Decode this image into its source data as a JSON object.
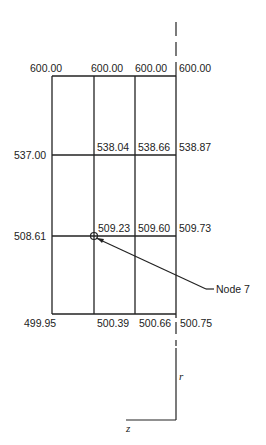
{
  "figure": {
    "caption_fragment": "",
    "grid": {
      "column_x": [
        52,
        94,
        135,
        176
      ],
      "row_y": [
        76,
        155,
        236,
        314
      ]
    },
    "node_labels": {
      "top": [
        "600.00",
        "600.00",
        "600.00",
        "600.00"
      ],
      "row2": [
        "537.00",
        "538.04",
        "538.66",
        "538.87"
      ],
      "row3": [
        "508.61",
        "509.23",
        "509.60",
        "509.73"
      ],
      "bottom": [
        "499.95",
        "500.39",
        "500.66",
        "500.75"
      ]
    },
    "callout": {
      "label": "Node 7",
      "node_x": 94,
      "node_y": 236
    },
    "axes": {
      "r_label": "r",
      "z_label": "z"
    },
    "line_color": "#222222"
  }
}
